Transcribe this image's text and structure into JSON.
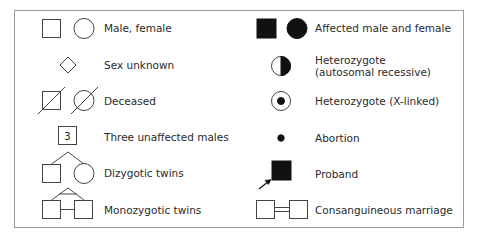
{
  "figure": {
    "colors": {
      "stroke": "#444444",
      "fill_affected": "#111111",
      "border": "#9a9a9a",
      "text": "#2a2a2a"
    }
  },
  "legend": {
    "left_column": [
      {
        "symbol": "male-square-female-circle",
        "label": "Male, female"
      },
      {
        "symbol": "diamond",
        "label": "Sex unknown"
      },
      {
        "symbol": "deceased-square-circle-slashed",
        "label": "Deceased"
      },
      {
        "symbol": "square-with-number",
        "number": "3",
        "label": "Three unaffected males"
      },
      {
        "symbol": "dizygotic-twins",
        "label": "Dizygotic twins"
      },
      {
        "symbol": "monozygotic-twins",
        "label": "Monozygotic twins"
      }
    ],
    "right_column": [
      {
        "symbol": "filled-square-filled-circle",
        "label": "Affected male and female"
      },
      {
        "symbol": "half-filled-circle",
        "label_line1": "Heterozygote",
        "label_line2": "(autosomal recessive)"
      },
      {
        "symbol": "circle-with-dot",
        "label": "Heterozygote (X-linked)"
      },
      {
        "symbol": "small-filled-dot",
        "label": "Abortion"
      },
      {
        "symbol": "filled-square-with-arrow",
        "label": "Proband"
      },
      {
        "symbol": "double-line-marriage",
        "label": "Consanguineous marriage"
      }
    ]
  }
}
